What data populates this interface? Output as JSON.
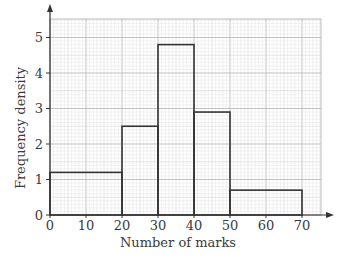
{
  "chart_data": {
    "type": "histogram",
    "title": "",
    "xlabel": "Number of marks",
    "ylabel": "Frequency density",
    "xlim": [
      0,
      76
    ],
    "ylim": [
      0,
      5.5
    ],
    "x_ticks": [
      0,
      10,
      20,
      30,
      40,
      50,
      60,
      70
    ],
    "y_ticks": [
      0,
      1,
      2,
      3,
      4,
      5
    ],
    "grid": true,
    "legend": null,
    "bins": [
      {
        "from": 0,
        "to": 20,
        "frequency_density": 1.2
      },
      {
        "from": 20,
        "to": 30,
        "frequency_density": 2.5
      },
      {
        "from": 30,
        "to": 40,
        "frequency_density": 4.8
      },
      {
        "from": 40,
        "to": 50,
        "frequency_density": 2.9
      },
      {
        "from": 50,
        "to": 70,
        "frequency_density": 0.7
      }
    ]
  },
  "colors": {
    "bar_outline": "#333333",
    "axis": "#333333",
    "grid_major": "#b4b4b4",
    "grid_minor": "#e2e2e2",
    "text": "#3a3a3a"
  }
}
